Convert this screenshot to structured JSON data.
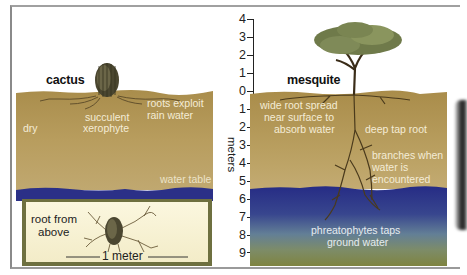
{
  "diagram": {
    "left_panel": {
      "title": "cactus",
      "labels": {
        "succulent": "succulent",
        "xerophyte": "xerophyte",
        "roots_exploit": "roots exploit",
        "rain_water": "rain water",
        "dry": "dry",
        "water_table": "water table"
      },
      "inset": {
        "root_from": "root from",
        "above": "above",
        "scale": "1 meter"
      }
    },
    "axis": {
      "label": "meters",
      "ticks": [
        "4",
        "3",
        "2",
        "1",
        "0",
        "1",
        "2",
        "3",
        "4",
        "5",
        "6",
        "7",
        "8",
        "9"
      ]
    },
    "right_panel": {
      "title": "mesquite",
      "labels": {
        "wide_root_1": "wide root spread",
        "wide_root_2": "near surface to",
        "wide_root_3": "absorb water",
        "deep_tap_root": "deep tap root",
        "branches_1": "branches when",
        "branches_2": "water is",
        "branches_3": "encountered",
        "phreato_1": "phreatophytes taps",
        "phreato_2": "ground water"
      }
    },
    "colors": {
      "soil": "#b59a5a",
      "water_dark": "#2a2f82",
      "water_mid": "#4a5f92",
      "ground_olive": "#7d8440",
      "inset_cream": "#f8f3d8"
    }
  }
}
